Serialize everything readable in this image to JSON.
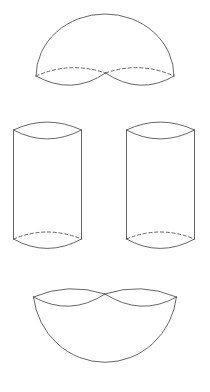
{
  "figure": {
    "background_color": "#ffffff",
    "stroke_color": "#555555",
    "stroke_width": 0.9,
    "canvas": {
      "width": 210,
      "height": 392
    },
    "shapes": [
      {
        "name": "top-dome",
        "label": "Upper hemisphere with twin elliptical bases",
        "kind": "dome",
        "bounds": {
          "x": 33,
          "y": 13,
          "width": 142,
          "height": 80
        },
        "dome_arc": "M 36 76 A 69 62 0 0 1 174 76",
        "left_lens": {
          "start": {
            "x": 36,
            "y": 76
          },
          "end": {
            "x": 105.5,
            "y": 73
          },
          "back_arc_dashed": "M 36 76 Q 70 61 105.5 73",
          "front_arc_solid": "M 36 76 Q 72 96 105.5 73"
        },
        "right_lens": {
          "start": {
            "x": 105.5,
            "y": 73
          },
          "end": {
            "x": 174,
            "y": 76
          },
          "back_arc_dashed": "M 105.5 73 Q 140 61 174 76",
          "front_arc_solid": "M 105.5 73 Q 140 96 174 76"
        }
      },
      {
        "name": "left-cylinder",
        "label": "Left circular cylinder",
        "kind": "cylinder",
        "bounds": {
          "x": 13,
          "y": 122,
          "width": 69,
          "height": 126
        },
        "top_lens": {
          "left": {
            "x": 13.5,
            "y": 130
          },
          "right": {
            "x": 81.5,
            "y": 130
          },
          "back_arc_solid": "M 13.5 130 Q 47 114 81.5 130",
          "front_arc_solid": "M 13.5 130 Q 47 148 81.5 130"
        },
        "left_side": "M 13.5 130 L 13.5 239",
        "right_side": "M 81.5 130 L 81.5 239",
        "bottom_lens": {
          "left": {
            "x": 13.5,
            "y": 239
          },
          "right": {
            "x": 81.5,
            "y": 239
          },
          "back_arc_dashed": "M 13.5 239 Q 47 225 81.5 239",
          "front_arc_solid": "M 13.5 239 Q 47 258 81.5 239"
        }
      },
      {
        "name": "right-cylinder",
        "label": "Right circular cylinder",
        "kind": "cylinder",
        "bounds": {
          "x": 126,
          "y": 122,
          "width": 69,
          "height": 126
        },
        "top_lens": {
          "left": {
            "x": 126.5,
            "y": 130
          },
          "right": {
            "x": 194.5,
            "y": 130
          },
          "back_arc_solid": "M 126.5 130 Q 160 114 194.5 130",
          "front_arc_solid": "M 126.5 130 Q 160 148 194.5 130"
        },
        "left_side": "M 126.5 130 L 126.5 239",
        "right_side": "M 194.5 130 L 194.5 239",
        "bottom_lens": {
          "left": {
            "x": 126.5,
            "y": 239
          },
          "right": {
            "x": 194.5,
            "y": 239
          },
          "back_arc_dashed": "M 126.5 239 Q 160 225 194.5 239",
          "front_arc_solid": "M 126.5 239 Q 160 258 194.5 239"
        }
      },
      {
        "name": "bottom-bowl",
        "label": "Lower hemispherical bowl with twin elliptical rims",
        "kind": "bowl",
        "bounds": {
          "x": 33,
          "y": 292,
          "width": 144,
          "height": 80
        },
        "bowl_arc": "M 33.5 297 A 72 74 0 0 0 176.5 297",
        "left_lens": {
          "start": {
            "x": 33.5,
            "y": 297
          },
          "end": {
            "x": 105,
            "y": 294
          },
          "back_arc_solid": "M 33.5 297 Q 68 282 105 294",
          "front_arc_solid": "M 33.5 297 Q 70 317 105 294"
        },
        "right_lens": {
          "start": {
            "x": 105,
            "y": 294
          },
          "end": {
            "x": 176.5,
            "y": 297
          },
          "back_arc_solid": "M 105 294 Q 141 282 176.5 297",
          "front_arc_solid": "M 105 294 Q 141 317 176.5 297"
        }
      }
    ]
  }
}
